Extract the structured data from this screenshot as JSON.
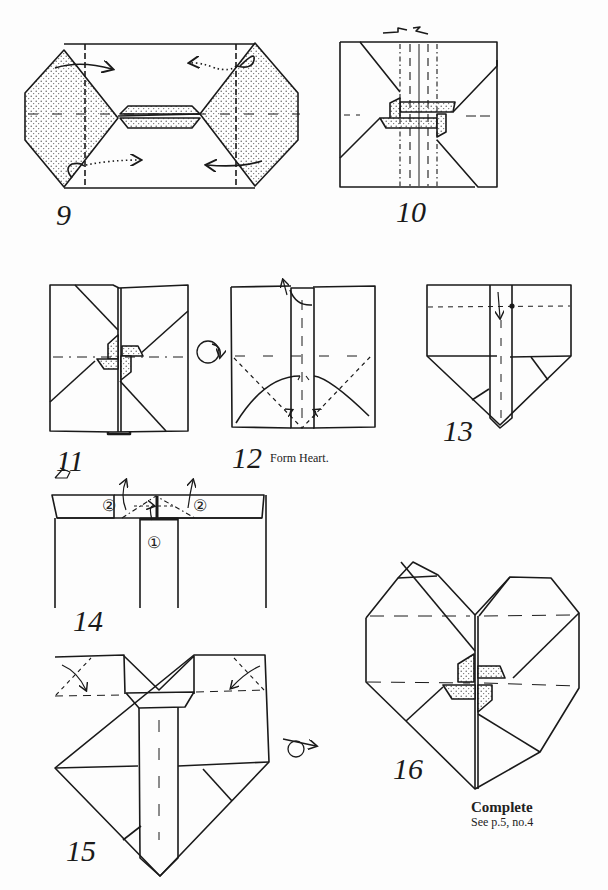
{
  "page": {
    "colors": {
      "ink": "#1a1a1a",
      "paper": "#fdfdfd",
      "stipple": "#555555"
    }
  },
  "steps": [
    {
      "number": "9",
      "caption": ""
    },
    {
      "number": "10",
      "caption": ""
    },
    {
      "number": "11",
      "caption": ""
    },
    {
      "number": "12",
      "caption": "Form Heart."
    },
    {
      "number": "13",
      "caption": ""
    },
    {
      "number": "14",
      "caption": ""
    },
    {
      "number": "15",
      "caption": ""
    },
    {
      "number": "16",
      "caption": ""
    }
  ],
  "step14": {
    "marker_1": "①",
    "marker_2": "②"
  },
  "complete": {
    "title": "Complete",
    "reference": "See p.5, no.4"
  },
  "symbols": [
    "turn-over-icon",
    "valley-fold-arrow-icon",
    "mountain-fold-line",
    "valley-fold-line"
  ]
}
